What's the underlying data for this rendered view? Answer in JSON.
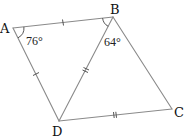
{
  "diagram": {
    "type": "quadrilateral-with-diagonal",
    "vertices": [
      {
        "label": "A",
        "x": 13,
        "y": 28
      },
      {
        "label": "B",
        "x": 113,
        "y": 17
      },
      {
        "label": "C",
        "x": 172,
        "y": 109
      },
      {
        "label": "D",
        "x": 59,
        "y": 121
      }
    ],
    "edges": [
      {
        "from": "A",
        "to": "B",
        "ticks": 1
      },
      {
        "from": "B",
        "to": "C",
        "ticks": 0
      },
      {
        "from": "C",
        "to": "D",
        "ticks": 2
      },
      {
        "from": "D",
        "to": "A",
        "ticks": 1
      },
      {
        "from": "B",
        "to": "D",
        "ticks": 2
      }
    ],
    "angles": [
      {
        "vertex": "A",
        "value": "76°",
        "between": [
          "B",
          "D"
        ]
      },
      {
        "vertex": "B",
        "value": "64°",
        "between": [
          "A",
          "D"
        ]
      }
    ],
    "colors": {
      "edge": "#8a8a8a",
      "label": "#111111"
    }
  }
}
